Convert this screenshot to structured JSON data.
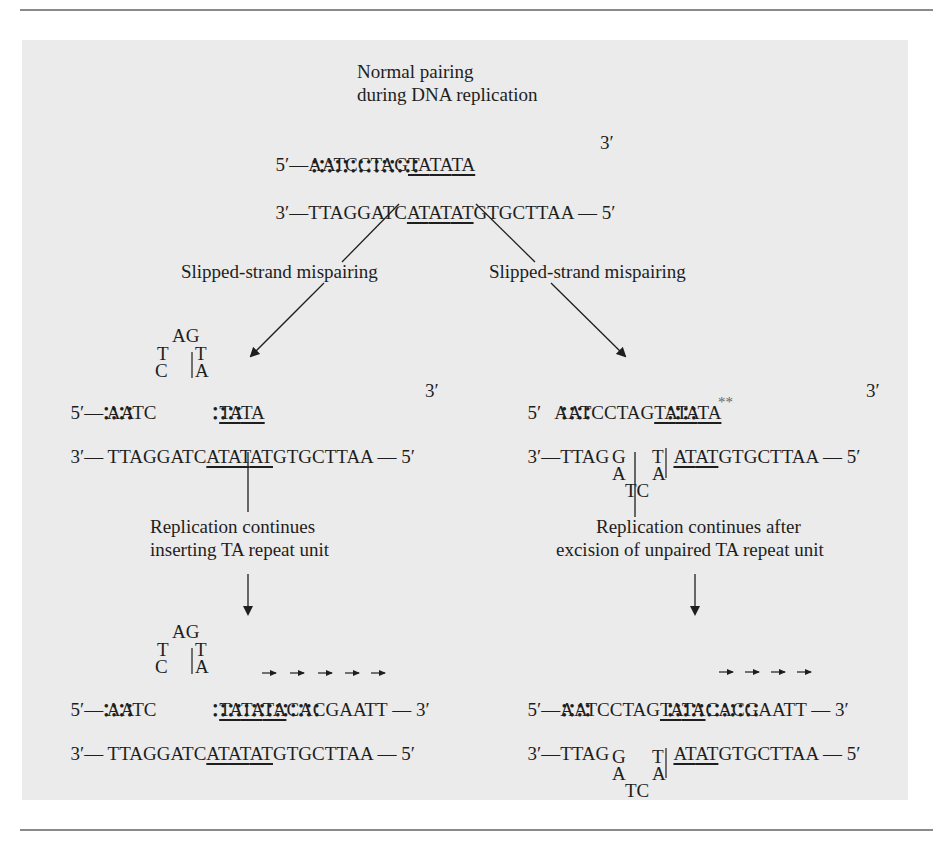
{
  "title": {
    "line1": "Normal pairing",
    "line2": "during DNA replication"
  },
  "normal": {
    "top_5prime": "5′—",
    "top_seq_plain": "AATCCTAG",
    "top_repeats": [
      "TA",
      "TA",
      "TA"
    ],
    "top_3prime": "3′",
    "bottom_3prime": "3′—",
    "bottom_seq_plain_left": "TTAGGATC",
    "bottom_repeats": [
      "AT",
      "AT",
      "AT"
    ],
    "bottom_seq_plain_right": "GTGCTTAA",
    "bottom_5prime": "— 5′"
  },
  "branches": {
    "left_label": "Slipped-strand mispairing",
    "right_label": "Slipped-strand mispairing"
  },
  "left_mid": {
    "loop": {
      "top": "AG",
      "left_upper": "T",
      "left_lower": "C",
      "right_upper": "T",
      "right_lower": "A"
    },
    "top_5prime": "5′—",
    "top_seq": "AATC",
    "top_repeats": [
      "TA",
      "TA"
    ],
    "top_3prime": "3′",
    "bottom_3prime": "3′—",
    "bottom_seq_left": "TTAGGATC",
    "bottom_repeats": [
      "AT",
      "AT",
      "AT"
    ],
    "bottom_seq_right": "GTGCTTAA",
    "bottom_5prime": "— 5′",
    "step_label_line1": "Replication continues",
    "step_label_line2": "inserting TA repeat unit"
  },
  "right_mid": {
    "top_5prime": "5′",
    "top_seq": "AATCCTAG",
    "top_repeats": [
      "TA",
      "TA",
      "TA"
    ],
    "unpaired_marker": "**",
    "top_3prime": "3′",
    "bottom_3prime": "3′—",
    "bottom_seq_left": "TTAG",
    "bottom_repeats": [
      "AT",
      "AT"
    ],
    "bottom_seq_right": "GTGCTTAA",
    "bottom_5prime": "— 5′",
    "loop": {
      "left_upper": "G",
      "left_lower": "A",
      "right_upper": "T",
      "right_lower": "A",
      "bottom": "TC"
    },
    "step_label_line1": "Replication continues after",
    "step_label_line2": "excision of unpaired TA repeat unit"
  },
  "left_final": {
    "loop": {
      "top": "AG",
      "left_upper": "T",
      "left_lower": "C",
      "right_upper": "T",
      "right_lower": "A"
    },
    "top_5prime": "5′—",
    "top_seq": "AATC",
    "top_repeats": [
      "TA",
      "TA",
      "TA"
    ],
    "top_new": "CACGAATT",
    "top_3prime": "— 3′",
    "bottom_3prime": "3′—",
    "bottom_seq_left": "TTAGGATC",
    "bottom_repeats": [
      "AT",
      "AT",
      "AT"
    ],
    "bottom_seq_right": "GTGCTTAA",
    "bottom_5prime": "— 5′",
    "synthesis_arrows": 5
  },
  "right_final": {
    "top_5prime": "5′—",
    "top_seq": "AATCCTAG",
    "top_repeats": [
      "TA",
      "TA"
    ],
    "top_new": "CACGAATT",
    "top_3prime": "— 3′",
    "bottom_3prime": "3′—",
    "bottom_seq_left": "TTAG",
    "bottom_repeats": [
      "AT",
      "AT"
    ],
    "bottom_seq_right": "GTGCTTAA",
    "bottom_5prime": "— 5′",
    "loop": {
      "left_upper": "G",
      "left_lower": "A",
      "right_upper": "T",
      "right_lower": "A",
      "bottom": "TC"
    },
    "synthesis_arrows": 4
  },
  "colors": {
    "panel": "#ebebeb",
    "text": "#1e1e1e",
    "rule": "#8a8a8a"
  }
}
